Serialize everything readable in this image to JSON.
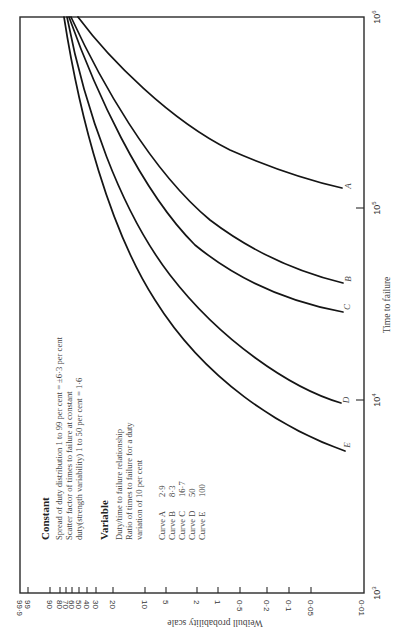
{
  "chart_data": {
    "type": "line",
    "orientation": "rotated 90 degrees counter-clockwise on page",
    "title": "",
    "xlabel": "Time to failure",
    "ylabel": "Weibull probability scale",
    "x_scale": "log",
    "xlim": [
      1000,
      1000000
    ],
    "x_ticks": [
      "10^3",
      "10^4",
      "10^5",
      "10^6"
    ],
    "y_scale": "weibull probability (per cent)",
    "y_ticks": [
      "99.9",
      "99",
      "90",
      "80",
      "70",
      "60",
      "50",
      "40",
      "30",
      "20",
      "10",
      "5",
      "2",
      "1",
      "0.5",
      "0.2",
      "0.1",
      "0.05",
      "0.01"
    ],
    "ylim": [
      0.01,
      99.9
    ],
    "grid": false,
    "legend": "text block listing curves A-E with duty/time ratio values",
    "series": [
      {
        "name": "Curve A",
        "ratio": 2.9,
        "points": [
          [
            850000,
            99.9
          ],
          [
            600000,
            60
          ],
          [
            400000,
            20
          ],
          [
            250000,
            5
          ],
          [
            150000,
            1
          ],
          [
            120000,
            0.05
          ]
        ]
      },
      {
        "name": "Curve B",
        "ratio": 8.3,
        "points": [
          [
            700000,
            99.9
          ],
          [
            400000,
            70
          ],
          [
            200000,
            20
          ],
          [
            100000,
            2
          ],
          [
            60000,
            0.2
          ],
          [
            40000,
            0.05
          ]
        ]
      },
      {
        "name": "Curve C",
        "ratio": 16.7,
        "points": [
          [
            690000,
            99.9
          ],
          [
            350000,
            70
          ],
          [
            160000,
            20
          ],
          [
            70000,
            2
          ],
          [
            40000,
            0.2
          ],
          [
            30000,
            0.05
          ]
        ]
      },
      {
        "name": "Curve D",
        "ratio": 50,
        "points": [
          [
            680000,
            99.9
          ],
          [
            300000,
            60
          ],
          [
            110000,
            20
          ],
          [
            35000,
            2
          ],
          [
            15000,
            0.2
          ],
          [
            10000,
            0.05
          ]
        ]
      },
      {
        "name": "Curve E",
        "ratio": 100,
        "points": [
          [
            670000,
            99.9
          ],
          [
            280000,
            60
          ],
          [
            95000,
            20
          ],
          [
            25000,
            2
          ],
          [
            10000,
            0.2
          ],
          [
            6000,
            0.05
          ]
        ]
      }
    ]
  },
  "axis": {
    "prob_title": "Weibull probability scale",
    "time_title": "Time to failure",
    "prob_ticks": [
      {
        "label": "99·9",
        "x": 20
      },
      {
        "label": "99",
        "x": 28
      },
      {
        "label": "90",
        "x": 50
      },
      {
        "label": "80",
        "x": 60
      },
      {
        "label": "70",
        "x": 66
      },
      {
        "label": "60",
        "x": 72
      },
      {
        "label": "50",
        "x": 79
      },
      {
        "label": "40",
        "x": 87
      },
      {
        "label": "30",
        "x": 96
      },
      {
        "label": "20",
        "x": 113
      },
      {
        "label": "10",
        "x": 145
      },
      {
        "label": "5",
        "x": 166
      },
      {
        "label": "2",
        "x": 197
      },
      {
        "label": "1",
        "x": 218
      },
      {
        "label": "0·5",
        "x": 240
      },
      {
        "label": "0·2",
        "x": 267
      },
      {
        "label": "0·1",
        "x": 289
      },
      {
        "label": "0·05",
        "x": 311
      },
      {
        "label": "0·01",
        "x": 362
      }
    ],
    "time_ticks": [
      {
        "base": "10",
        "exp": "3",
        "y": 593
      },
      {
        "base": "10",
        "exp": "4",
        "y": 400
      },
      {
        "base": "10",
        "exp": "5",
        "y": 208
      },
      {
        "base": "10",
        "exp": "6",
        "y": 17
      }
    ]
  },
  "curves": [
    {
      "letter": "A",
      "path": "M78,17 C110,60 170,120 230,150 C280,172 320,183 342,188",
      "lx": 351,
      "ly": 186
    },
    {
      "letter": "B",
      "path": "M71,17 C100,80 150,170 210,220 C260,258 310,275 343,283",
      "lx": 351,
      "ly": 279
    },
    {
      "letter": "C",
      "path": "M69,17 C95,90 140,190 195,245 C250,290 305,305 343,312",
      "lx": 350,
      "ly": 307
    },
    {
      "letter": "D",
      "path": "M67,17 C85,110 120,210 170,275 C220,340 290,388 341,403",
      "lx": 349,
      "ly": 400
    },
    {
      "letter": "E",
      "path": "M64,17 C80,120 110,230 155,300 C205,380 280,428 345,451",
      "lx": 350,
      "ly": 445
    }
  ],
  "annotations": {
    "constant": {
      "heading": "Constant",
      "lines": [
        "Spread of duty distribution  1  to  99 per cent = ±6·3 per cent",
        "Scatter factor of  times to failure  at constant",
        "duty(strength variability)     1  to  50 per cent =  1·6"
      ]
    },
    "variable": {
      "heading": "Variable",
      "lines": [
        "Duty/time to failure relationship",
        "Ratio of times to failure for a duty",
        "variation of  10 per cent"
      ]
    },
    "curve_list": [
      {
        "name": "Curve A",
        "value": "2·9"
      },
      {
        "name": "Curve B",
        "value": "8·3"
      },
      {
        "name": "Curve C",
        "value": "16·7"
      },
      {
        "name": "Curve D",
        "value": "50"
      },
      {
        "name": "Curve E",
        "value": "100"
      }
    ]
  },
  "colors": {
    "ink": "#151515",
    "frame": "#2a2a2a",
    "text": "#444444",
    "background": "#ffffff"
  }
}
